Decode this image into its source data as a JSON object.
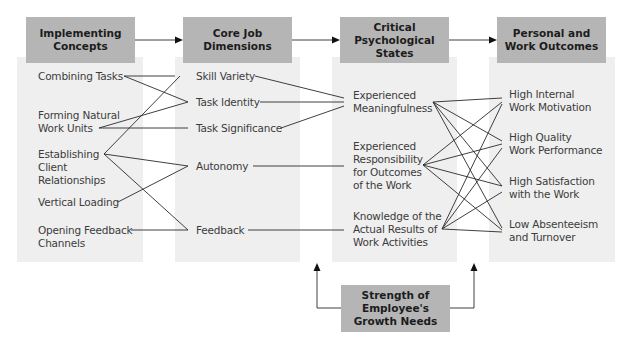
{
  "diagram": {
    "columns": [
      {
        "id": "implementing-concepts",
        "header": [
          "Implementing",
          "Concepts"
        ],
        "items": [
          {
            "id": "combining-tasks",
            "label": "Combining Tasks"
          },
          {
            "id": "forming-natural-work-units",
            "label": "Forming Natural\nWork Units"
          },
          {
            "id": "establishing-client-relationships",
            "label": "Establishing\nClient\nRelationships"
          },
          {
            "id": "vertical-loading",
            "label": "Vertical Loading"
          },
          {
            "id": "opening-feedback-channels",
            "label": "Opening Feedback\nChannels"
          }
        ]
      },
      {
        "id": "core-job-dimensions",
        "header": [
          "Core Job",
          "Dimensions"
        ],
        "items": [
          {
            "id": "skill-variety",
            "label": "Skill Variety"
          },
          {
            "id": "task-identity",
            "label": "Task Identity"
          },
          {
            "id": "task-significance",
            "label": "Task Significance"
          },
          {
            "id": "autonomy",
            "label": "Autonomy"
          },
          {
            "id": "feedback",
            "label": "Feedback"
          }
        ]
      },
      {
        "id": "critical-psychological-states",
        "header": [
          "Critical",
          "Psychological",
          "States"
        ],
        "items": [
          {
            "id": "experienced-meaningfulness",
            "label": "Experienced\nMeaningfulness"
          },
          {
            "id": "experienced-responsibility",
            "label": "Experienced\nResponsibility\nfor Outcomes\nof the Work"
          },
          {
            "id": "knowledge-of-results",
            "label": "Knowledge of the\nActual Results of\nWork Activities"
          }
        ]
      },
      {
        "id": "personal-work-outcomes",
        "header": [
          "Personal and",
          "Work Outcomes"
        ],
        "items": [
          {
            "id": "high-internal-motivation",
            "label": "High Internal\nWork Motivation"
          },
          {
            "id": "high-quality-performance",
            "label": "High Quality\nWork Performance"
          },
          {
            "id": "high-satisfaction",
            "label": "High Satisfaction\nwith the Work"
          },
          {
            "id": "low-absenteeism",
            "label": "Low Absenteeism\nand Turnover"
          }
        ]
      }
    ],
    "moderator": {
      "id": "growth-need-strength",
      "header": [
        "Strength of",
        "Employee's",
        "Growth Needs"
      ]
    },
    "connections": [
      [
        "combining-tasks",
        "skill-variety"
      ],
      [
        "combining-tasks",
        "task-identity"
      ],
      [
        "forming-natural-work-units",
        "task-identity"
      ],
      [
        "forming-natural-work-units",
        "task-significance"
      ],
      [
        "establishing-client-relationships",
        "skill-variety"
      ],
      [
        "establishing-client-relationships",
        "autonomy"
      ],
      [
        "establishing-client-relationships",
        "feedback"
      ],
      [
        "vertical-loading",
        "autonomy"
      ],
      [
        "opening-feedback-channels",
        "feedback"
      ],
      [
        "skill-variety",
        "experienced-meaningfulness"
      ],
      [
        "task-identity",
        "experienced-meaningfulness"
      ],
      [
        "task-significance",
        "experienced-meaningfulness"
      ],
      [
        "autonomy",
        "experienced-responsibility"
      ],
      [
        "feedback",
        "knowledge-of-results"
      ],
      [
        "experienced-meaningfulness",
        "high-internal-motivation"
      ],
      [
        "experienced-meaningfulness",
        "high-quality-performance"
      ],
      [
        "experienced-meaningfulness",
        "high-satisfaction"
      ],
      [
        "experienced-meaningfulness",
        "low-absenteeism"
      ],
      [
        "experienced-responsibility",
        "high-internal-motivation"
      ],
      [
        "experienced-responsibility",
        "high-quality-performance"
      ],
      [
        "experienced-responsibility",
        "high-satisfaction"
      ],
      [
        "experienced-responsibility",
        "low-absenteeism"
      ],
      [
        "knowledge-of-results",
        "high-internal-motivation"
      ],
      [
        "knowledge-of-results",
        "high-quality-performance"
      ],
      [
        "knowledge-of-results",
        "high-satisfaction"
      ],
      [
        "knowledge-of-results",
        "low-absenteeism"
      ]
    ],
    "colors": {
      "header_fill": "#b5b5b5",
      "panel_fill": "#efefef",
      "text": "#3c3c3c",
      "line": "#2a2a2a"
    }
  }
}
